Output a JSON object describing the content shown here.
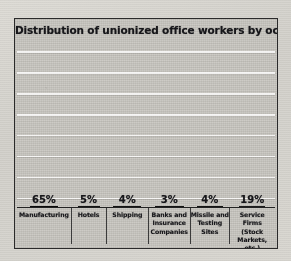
{
  "figure": {
    "title": "Distribution of unionized office workers by occupation",
    "frame_color": "#2a2a2a",
    "background_color": "#c9c7c1",
    "gridline_color": "#ffffff"
  },
  "chart_data": {
    "type": "bar",
    "title": "Distribution of unionized office workers by occupation",
    "xlabel": "",
    "ylabel": "",
    "ylim": [
      0,
      70
    ],
    "grid": true,
    "gridline_count": 8,
    "legend": "none",
    "categories": [
      "Manufacturing",
      "Hotels",
      "Shipping",
      "Banks and Insurance Companies",
      "Missile and Testing Sites",
      "Service Firms (Stock Markets, etc.)"
    ],
    "values": [
      65,
      5,
      4,
      3,
      4,
      19
    ],
    "data_labels": [
      "65%",
      "5%",
      "4%",
      "3%",
      "4%",
      "19%"
    ],
    "bar_fills": [
      "solid-black",
      "diagonal-hatch",
      "cross-hatch",
      "stipple",
      "vertical-stripe",
      "open-outline"
    ]
  },
  "bars": [
    {
      "label_lines": [
        "Manufacturing"
      ],
      "label": "Manufacturing",
      "pct": "65%",
      "value": 65,
      "fill": "fill-solid",
      "width_pct": 52,
      "col_flex": 1.18
    },
    {
      "label_lines": [
        "Hotels"
      ],
      "label": "Hotels",
      "pct": "5%",
      "value": 5,
      "fill": "fill-diag",
      "width_pct": 62,
      "col_flex": 0.78
    },
    {
      "label_lines": [
        "Shipping"
      ],
      "label": "Shipping",
      "pct": "4%",
      "value": 4,
      "fill": "fill-cross",
      "width_pct": 66,
      "col_flex": 0.92
    },
    {
      "label_lines": [
        "Banks and",
        "Insurance",
        "Companies"
      ],
      "label": "Banks and Insurance Companies",
      "pct": "3%",
      "value": 3,
      "fill": "fill-stipple",
      "width_pct": 70,
      "col_flex": 0.92
    },
    {
      "label_lines": [
        "Missile and",
        "Testing",
        "Sites"
      ],
      "label": "Missile and Testing Sites",
      "pct": "4%",
      "value": 4,
      "fill": "fill-vert",
      "width_pct": 66,
      "col_flex": 0.86
    },
    {
      "label_lines": [
        "Service Firms",
        "(Stock Markets,",
        "etc.)"
      ],
      "label": "Service Firms (Stock Markets, etc.)",
      "pct": "19%",
      "value": 19,
      "fill": "fill-open",
      "width_pct": 58,
      "col_flex": 1.0
    }
  ]
}
